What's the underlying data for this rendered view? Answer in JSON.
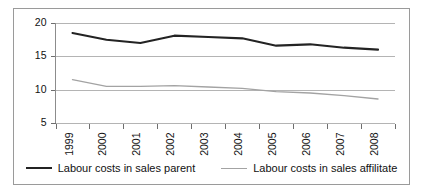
{
  "chart_data": {
    "type": "line",
    "title": "",
    "subtitle": "",
    "xlabel": "",
    "ylabel": "",
    "categories": [
      "1999",
      "2000",
      "2001",
      "2002",
      "2003",
      "2004",
      "2005",
      "2006",
      "2007",
      "2008"
    ],
    "ylim": [
      5,
      20
    ],
    "yticks": [
      5,
      10,
      15,
      20
    ],
    "ytick_labels": [
      "5",
      "10",
      "15",
      "20"
    ],
    "grid": "horizontal",
    "legend_position": "bottom",
    "series": [
      {
        "name": "Labour costs in sales parent",
        "color": "#232323",
        "line_width": "thick",
        "values": [
          18.5,
          17.5,
          17.0,
          18.1,
          17.9,
          17.7,
          16.6,
          16.8,
          16.3,
          16.0
        ]
      },
      {
        "name": "Labour costs in sales affilitate",
        "color": "#a3a3a3",
        "line_width": "thin",
        "values": [
          11.5,
          10.5,
          10.5,
          10.6,
          10.4,
          10.2,
          9.7,
          9.5,
          9.1,
          8.6
        ]
      }
    ]
  },
  "legend": {
    "entries": [
      {
        "label": "Labour costs in sales parent"
      },
      {
        "label": "Labour costs in sales affilitate"
      }
    ]
  }
}
